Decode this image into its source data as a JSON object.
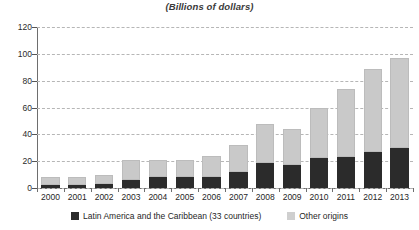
{
  "chart_data": {
    "type": "bar",
    "stacked": true,
    "title": "(Billions of dollars)",
    "xlabel": "",
    "ylabel": "",
    "ylim": [
      0,
      120
    ],
    "ytick_step": 20,
    "yticks": [
      0,
      20,
      40,
      60,
      80,
      100,
      120
    ],
    "grid": true,
    "legend_position": "bottom",
    "categories": [
      "2000",
      "2001",
      "2002",
      "2003",
      "2004",
      "2005",
      "2006",
      "2007",
      "2008",
      "2009",
      "2010",
      "2011",
      "2012",
      "2013"
    ],
    "series": [
      {
        "name": "Latin America and the Caribbean (33 countries)",
        "color": "#2b2b2b",
        "values": [
          2,
          2,
          3,
          6,
          8,
          8,
          8,
          12,
          19,
          17,
          22,
          23,
          27,
          30
        ]
      },
      {
        "name": "Other origins",
        "color": "#c9c9c9",
        "values": [
          6,
          6,
          7,
          15,
          13,
          13,
          16,
          20,
          29,
          27,
          38,
          51,
          62,
          67
        ]
      }
    ],
    "totals": [
      8,
      8,
      10,
      21,
      21,
      21,
      24,
      32,
      48,
      44,
      60,
      74,
      89,
      97
    ]
  },
  "legend": {
    "items": [
      {
        "label": "Latin America and the Caribbean (33 countries)"
      },
      {
        "label": "Other origins"
      }
    ]
  }
}
